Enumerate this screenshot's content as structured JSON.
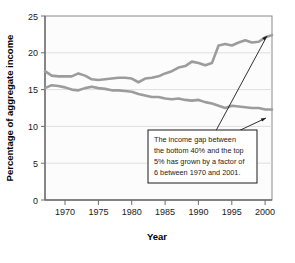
{
  "chart_data": {
    "type": "line",
    "title": "",
    "xlabel": "Year",
    "ylabel": "Percentage of aggregate income",
    "xlim": [
      1967,
      2001
    ],
    "ylim": [
      0,
      25
    ],
    "xticks": [
      "1970",
      "1975",
      "1980",
      "1985",
      "1990",
      "1995",
      "2000"
    ],
    "yticks": [
      "0",
      "5",
      "10",
      "15",
      "20",
      "25"
    ],
    "grid": true,
    "legend_position": "none",
    "series": [
      {
        "name": "Top 5%",
        "color": "#9c9c9c",
        "x": [
          1967,
          1968,
          1969,
          1970,
          1971,
          1972,
          1973,
          1974,
          1975,
          1976,
          1977,
          1978,
          1979,
          1980,
          1981,
          1982,
          1983,
          1984,
          1985,
          1986,
          1987,
          1988,
          1989,
          1990,
          1991,
          1992,
          1993,
          1994,
          1995,
          1996,
          1997,
          1998,
          1999,
          2000,
          2001
        ],
        "values": [
          17.5,
          16.9,
          16.8,
          16.8,
          16.8,
          17.2,
          16.9,
          16.4,
          16.3,
          16.4,
          16.5,
          16.6,
          16.6,
          16.5,
          16.0,
          16.5,
          16.6,
          16.8,
          17.2,
          17.5,
          18.0,
          18.2,
          18.8,
          18.6,
          18.3,
          18.6,
          21.0,
          21.2,
          21.0,
          21.4,
          21.7,
          21.4,
          21.5,
          22.1,
          22.4
        ]
      },
      {
        "name": "Bottom 40%",
        "color": "#9c9c9c",
        "x": [
          1967,
          1968,
          1969,
          1970,
          1971,
          1972,
          1973,
          1974,
          1975,
          1976,
          1977,
          1978,
          1979,
          1980,
          1981,
          1982,
          1983,
          1984,
          1985,
          1986,
          1987,
          1988,
          1989,
          1990,
          1991,
          1992,
          1993,
          1994,
          1995,
          1996,
          1997,
          1998,
          1999,
          2000,
          2001
        ],
        "values": [
          15.2,
          15.6,
          15.5,
          15.3,
          15.0,
          14.9,
          15.2,
          15.4,
          15.2,
          15.1,
          14.9,
          14.9,
          14.8,
          14.7,
          14.4,
          14.2,
          14.0,
          14.0,
          13.8,
          13.7,
          13.8,
          13.6,
          13.5,
          13.6,
          13.3,
          13.1,
          12.8,
          12.5,
          12.8,
          12.7,
          12.6,
          12.5,
          12.5,
          12.3,
          12.3
        ]
      }
    ],
    "annotations": [
      {
        "name": "income-gap-callout",
        "lines": [
          "The income gap between",
          "the bottom 40% and the top",
          "5% has grown by a factor of",
          "6 between 1970 and 2001."
        ],
        "arrow_targets": [
          "top-5-percent-line-end",
          "bottom-40-percent-line-end"
        ]
      }
    ]
  }
}
